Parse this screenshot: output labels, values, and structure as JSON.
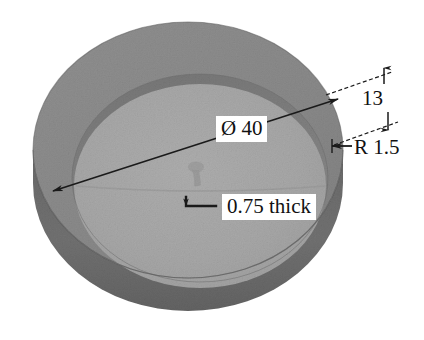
{
  "figure": {
    "kind": "3d-technical-illustration",
    "background_color": "#ffffff"
  },
  "part": {
    "outer_wall_color": "#6e6e6e",
    "rim_top_color": "#8c8c8c",
    "inner_face_color": "#a6a6a6",
    "inner_wall_shadow_color": "#787878",
    "edge_line_color": "#5a5a5a"
  },
  "annotations": {
    "line_color": "#1a1a1a",
    "text_color": "#111111",
    "diameter": {
      "name": "diameter-dimension",
      "text": "Ø 40"
    },
    "height": {
      "name": "height-dimension",
      "text": "13"
    },
    "radius": {
      "name": "radius-dimension",
      "text": "R 1.5"
    },
    "thickness": {
      "name": "thickness-dimension",
      "text": "0.75 thick"
    }
  }
}
